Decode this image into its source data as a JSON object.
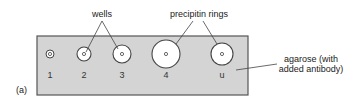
{
  "figure_label": "(a)",
  "callouts": {
    "wells": "wells",
    "precipitin_rings": "precipitin rings",
    "agarose_line1": "agarose (with",
    "agarose_line2": "added antibody)"
  },
  "wells": [
    {
      "label": "1",
      "ring_radius": 4
    },
    {
      "label": "2",
      "ring_radius": 7
    },
    {
      "label": "3",
      "ring_radius": 9
    },
    {
      "label": "4",
      "ring_radius": 14
    },
    {
      "label": "u",
      "ring_radius": 11
    }
  ],
  "colors": {
    "agarose": "#d4d4d4",
    "ring_fill": "#ffffff",
    "outline": "#444444"
  }
}
